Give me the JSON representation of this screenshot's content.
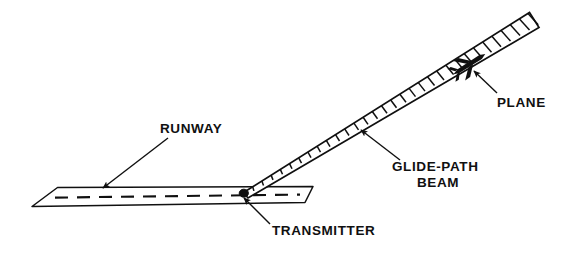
{
  "figure": {
    "type": "line-art-technical-diagram",
    "background_color": "#ffffff",
    "ink_color": "#101010"
  },
  "labels": {
    "runway": "RUNWAY",
    "glide_path_line1": "GLIDE-PATH",
    "glide_path_line2": "BEAM",
    "transmitter": "TRANSMITTER",
    "plane": "PLANE"
  },
  "elements": {
    "runway": {
      "name": "runway-surface",
      "shape": "parallelogram",
      "centerline_style": "dashed",
      "fill": "#ffffff",
      "stroke": "#101010"
    },
    "beam": {
      "name": "glide-path-beam",
      "shape": "tapered-hatched-wedge",
      "rung_count": 31,
      "apex_at": "transmitter",
      "fill": "#ffffff",
      "stroke": "#101010"
    },
    "transmitter": {
      "name": "transmitter-marker",
      "shape": "filled-dot",
      "fill": "#101010"
    },
    "plane": {
      "name": "plane-silhouette",
      "shape": "aircraft-top-view",
      "fill": "#101010"
    }
  },
  "leaders": {
    "runway": {
      "from": "label",
      "to": "runway-surface",
      "arrow": "filled"
    },
    "glide_path": {
      "from": "label",
      "to": "glide-path-beam",
      "arrow": "filled"
    },
    "transmitter": {
      "from": "label",
      "to": "transmitter-marker",
      "arrow": "filled"
    },
    "plane": {
      "from": "label",
      "to": "plane-silhouette",
      "arrow": "filled"
    }
  }
}
